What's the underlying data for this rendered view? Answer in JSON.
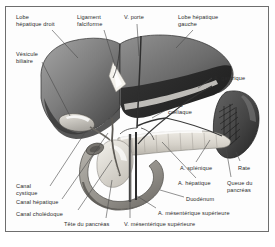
{
  "figure": {
    "style": "grayscale anatomical illustration with leader lines",
    "frame_color": "#6e6e6e",
    "background_color": "#fdfdfd",
    "text_color": "#2b2b2b",
    "leader_color": "#4a4a4a"
  },
  "palette": {
    "liver_light": "#8d8d8d",
    "liver_mid": "#6f6f6f",
    "liver_dark": "#3f3f3f",
    "liver_darkest": "#2a2a2a",
    "spleen_dark": "#4a4a4a",
    "spleen_hilum": "#1f1f1f",
    "pancreas": "#d8d4cc",
    "duodenum": "#9a9790",
    "gallbladder": "#c9c6bf",
    "bile_duct": "#e4e1d9",
    "vessel_dark": "#3a3a3a",
    "highlight": "#f2f0ea"
  },
  "labels": [
    {
      "id": "lobe-hepatique-droit",
      "text": "Lobe\nhépatique droit",
      "x": 16,
      "y": 14,
      "align": "left"
    },
    {
      "id": "ligament-falciforme",
      "text": "Ligament\nfalciforme",
      "x": 77,
      "y": 14,
      "align": "left"
    },
    {
      "id": "v-porte",
      "text": "V. porte",
      "x": 124,
      "y": 14,
      "align": "left"
    },
    {
      "id": "lobe-hepatique-gauche",
      "text": "Lobe hépatique\ngauche",
      "x": 178,
      "y": 14,
      "align": "left"
    },
    {
      "id": "vesicule-biliaire",
      "text": "Vésicule\nbiliaire",
      "x": 16,
      "y": 51,
      "align": "left"
    },
    {
      "id": "a-gastrique",
      "text": "A. gastrique",
      "x": 214,
      "y": 75,
      "align": "left"
    },
    {
      "id": "tronc-coeliaque",
      "text": "Tronc\ncœliaque",
      "x": 168,
      "y": 102,
      "align": "left"
    },
    {
      "id": "a-splenique",
      "text": "A. splénique",
      "x": 180,
      "y": 165,
      "align": "left"
    },
    {
      "id": "rate",
      "text": "Rate",
      "x": 238,
      "y": 165,
      "align": "left"
    },
    {
      "id": "a-hepatique",
      "text": "A. hépatique",
      "x": 178,
      "y": 180,
      "align": "left"
    },
    {
      "id": "queue-du-pancreas",
      "text": "Queue du\npancréas",
      "x": 227,
      "y": 180,
      "align": "left"
    },
    {
      "id": "canal-cystique",
      "text": "Canal\ncystique",
      "x": 16,
      "y": 183,
      "align": "left"
    },
    {
      "id": "canal-hepatique",
      "text": "Canal hépatique",
      "x": 16,
      "y": 199,
      "align": "left"
    },
    {
      "id": "canal-choledoque",
      "text": "Canal cholédoque",
      "x": 16,
      "y": 211,
      "align": "left"
    },
    {
      "id": "duodenum",
      "text": "Duodénum",
      "x": 186,
      "y": 196,
      "align": "left"
    },
    {
      "id": "a-mesenterique-superieure",
      "text": "A. mésentérique supérieure",
      "x": 158,
      "y": 210,
      "align": "left"
    },
    {
      "id": "tete-du-pancreas",
      "text": "Tête du pancréas",
      "x": 64,
      "y": 221,
      "align": "left"
    },
    {
      "id": "v-mesenterique-superieure",
      "text": "V. mésentérique supérieure",
      "x": 124,
      "y": 221,
      "align": "left"
    }
  ],
  "structures": [
    {
      "id": "liver-right-lobe",
      "name": "Lobe hépatique droit"
    },
    {
      "id": "liver-left-lobe",
      "name": "Lobe hépatique gauche"
    },
    {
      "id": "falciform-notch",
      "name": "Ligament falciforme"
    },
    {
      "id": "gallbladder",
      "name": "Vésicule biliaire"
    },
    {
      "id": "portal-vein",
      "name": "V. porte"
    },
    {
      "id": "spleen",
      "name": "Rate"
    },
    {
      "id": "pancreas-body",
      "name": "Corps et queue du pancréas"
    },
    {
      "id": "pancreas-head",
      "name": "Tête du pancréas"
    },
    {
      "id": "duodenum",
      "name": "Duodénum"
    },
    {
      "id": "bile-ducts",
      "name": "Canaux biliaires"
    },
    {
      "id": "celiac-trunk",
      "name": "Tronc cœliaque"
    },
    {
      "id": "gastric-artery",
      "name": "A. gastrique"
    },
    {
      "id": "splenic-artery",
      "name": "A. splénique"
    },
    {
      "id": "hepatic-artery",
      "name": "A. hépatique"
    },
    {
      "id": "sma",
      "name": "A. mésentérique supérieure"
    },
    {
      "id": "smv",
      "name": "V. mésentérique supérieure"
    }
  ]
}
